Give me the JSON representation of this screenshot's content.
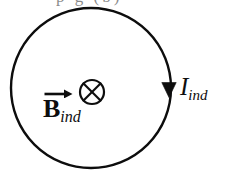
{
  "figure": {
    "type": "physics-diagram",
    "background_color": "#ffffff",
    "stroke_color": "#0d0d0d",
    "cropped_header_text": "p g (b)",
    "loop": {
      "name": "current-loop",
      "center_x": 91,
      "center_y": 88,
      "radius": 80,
      "stroke_width": 2.4
    },
    "arrowhead": {
      "name": "current-direction-arrowhead",
      "direction": "down",
      "tip_x": 169,
      "tip_y": 97,
      "width": 15,
      "height": 15
    },
    "field_symbol": {
      "name": "into-page-symbol",
      "glyph": "circle-with-x",
      "center_x": 92,
      "center_y": 92,
      "radius": 12,
      "stroke_width": 2.2
    },
    "labels": {
      "current": {
        "base": "I",
        "subscript": "ind",
        "full": "I_ind"
      },
      "field": {
        "base": "B",
        "subscript": "ind",
        "full": "B_ind",
        "vector_arrow": true,
        "bold": true
      }
    }
  }
}
